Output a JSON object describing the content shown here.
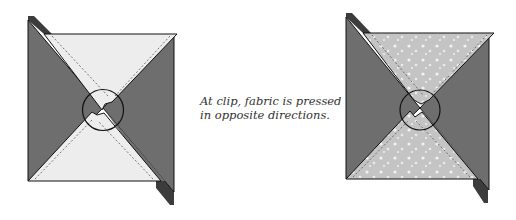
{
  "caption": {
    "line1": "At clip, fabric is pressed",
    "line2": "in opposite directions."
  },
  "colors": {
    "dark_fabric": "#6e6e6e",
    "dark_strip": "#3c3c3c",
    "light_fabric_left": "#ededed",
    "light_fabric_right": "#c4c4c4",
    "outline": "#111111",
    "background": "#ffffff"
  },
  "diagrams": [
    {
      "name": "left-pinwheel-block",
      "light_fabric": "plain light"
    },
    {
      "name": "right-pinwheel-block",
      "light_fabric": "light floral print"
    }
  ]
}
